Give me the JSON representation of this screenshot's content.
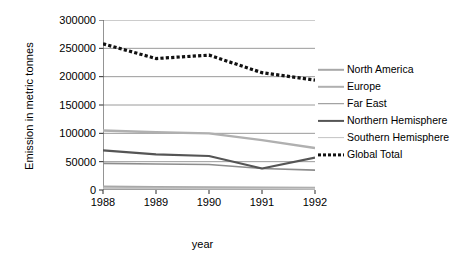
{
  "chart_data": {
    "type": "line",
    "title": "",
    "xlabel": "year",
    "ylabel": "Emission in metric tonnes",
    "categories": [
      "1988",
      "1989",
      "1990",
      "1991",
      "1992"
    ],
    "x": [
      1988,
      1989,
      1990,
      1991,
      1992
    ],
    "xlim": [
      1988,
      1992
    ],
    "ylim": [
      0,
      300000
    ],
    "yticks": [
      "0",
      "50000",
      "100000",
      "150000",
      "200000",
      "250000",
      "300000"
    ],
    "ytick_values": [
      0,
      50000,
      100000,
      150000,
      200000,
      250000,
      300000
    ],
    "grid": "horizontal",
    "legend_position": "right",
    "series": [
      {
        "name": "North America",
        "values": [
          6000,
          5000,
          4500,
          4000,
          3500
        ],
        "color": "#a8a8a8",
        "style": "solid",
        "width": 2.4
      },
      {
        "name": "Europe",
        "values": [
          105000,
          102000,
          100000,
          88000,
          74000
        ],
        "color": "#b0b0b0",
        "style": "solid",
        "width": 2.4
      },
      {
        "name": "Far East",
        "values": [
          47000,
          46000,
          45000,
          38000,
          35000
        ],
        "color": "#8d8d8d",
        "style": "solid",
        "width": 1.6
      },
      {
        "name": "Northern Hemisphere",
        "values": [
          70000,
          63000,
          60000,
          38000,
          57000
        ],
        "color": "#555555",
        "style": "solid",
        "width": 2.2
      },
      {
        "name": "Southern Hemisphere",
        "values": [
          3000,
          2800,
          2600,
          2400,
          2200
        ],
        "color": "#c4c4c4",
        "style": "solid",
        "width": 1.8
      },
      {
        "name": "Global Total",
        "values": [
          258000,
          232000,
          238000,
          207000,
          194000
        ],
        "color": "#111111",
        "style": "dashed",
        "width": 3.2
      }
    ]
  }
}
